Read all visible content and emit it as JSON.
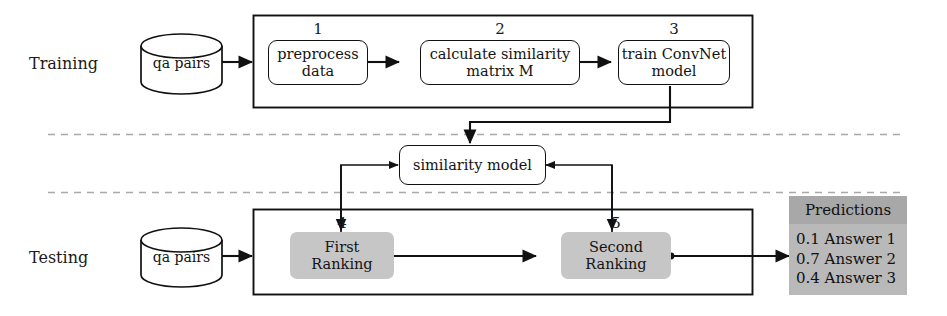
{
  "diagram": {
    "phases": [
      {
        "label": "Training"
      },
      {
        "label": "Testing"
      }
    ],
    "datastores": [
      {
        "label": "qa pairs"
      },
      {
        "label": "qa pairs"
      }
    ],
    "training_steps": [
      {
        "number": "1",
        "label": "preprocess\ndata",
        "line1": "preprocess",
        "line2": "data"
      },
      {
        "number": "2",
        "label": "calculate similarity matrix M",
        "line1": "calculate similarity",
        "line2": "matrix M"
      },
      {
        "number": "3",
        "label": "train ConvNet model",
        "line1": "train ConvNet",
        "line2": "model"
      }
    ],
    "shared_model": {
      "label": "similarity model"
    },
    "testing_steps": [
      {
        "number": "4",
        "label": "First Ranking",
        "line1": "First",
        "line2": "Ranking"
      },
      {
        "number": "5",
        "label": "Second Ranking",
        "line1": "Second",
        "line2": "Ranking"
      }
    ],
    "predictions": {
      "header": "Predictions",
      "rows": [
        {
          "score": "0.1",
          "answer": "Answer 1",
          "text": "0.1 Answer 1"
        },
        {
          "score": "0.7",
          "answer": "Answer 2",
          "text": "0.7 Answer 2"
        },
        {
          "score": "0.4",
          "answer": "Answer 3",
          "text": "0.4 Answer 3"
        }
      ]
    },
    "colors": {
      "stroke": "#111111",
      "gray_node": "#c6c6c6",
      "pred_body": "#b9b9b9",
      "pred_header": "#a8a8a8",
      "dashed_separator": "#a9a9a9",
      "background": "#ffffff"
    }
  }
}
